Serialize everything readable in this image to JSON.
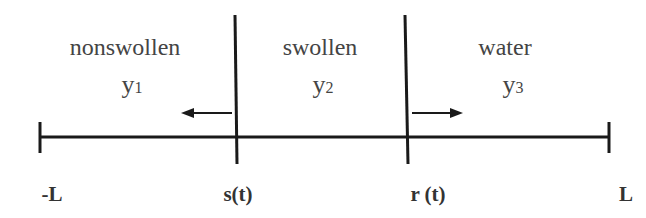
{
  "diagram": {
    "regions": [
      {
        "name": "nonswollen",
        "variable": "y",
        "subscript": "1"
      },
      {
        "name": "swollen",
        "variable": "y",
        "subscript": "2"
      },
      {
        "name": "water",
        "variable": "y",
        "subscript": "3"
      }
    ],
    "points": [
      {
        "label": "-L"
      },
      {
        "label": "s(t)"
      },
      {
        "label": "r (t)"
      },
      {
        "label": "L"
      }
    ],
    "arrows": [
      {
        "at": "s(t)",
        "direction": "left"
      },
      {
        "at": "r(t)",
        "direction": "right"
      }
    ],
    "colors": {
      "line": "#1a1a1a",
      "text": "#444444"
    }
  }
}
